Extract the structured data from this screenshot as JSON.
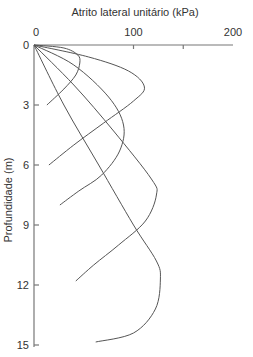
{
  "chart_data": {
    "type": "line",
    "title": "Atrito lateral unitário (kPa)",
    "xlabel": "Atrito lateral unitário (kPa)",
    "ylabel": "Profundidade (m)",
    "xlim": [
      0,
      200
    ],
    "ylim": [
      15,
      0
    ],
    "x_axis_position": "top",
    "y_inverted": true,
    "grid": false,
    "legend": null,
    "x_ticks": [
      0,
      100,
      150,
      200
    ],
    "x_tick_labels": [
      "0",
      "100",
      "",
      "200"
    ],
    "y_ticks": [
      0,
      3,
      6,
      9,
      12,
      15
    ],
    "y_tick_labels": [
      "0",
      "3",
      "6",
      "9",
      "12",
      "15"
    ],
    "series": [
      {
        "name": "Curve 1 (L = 3 m)",
        "points": [
          [
            0,
            0
          ],
          [
            30,
            0.15
          ],
          [
            44,
            0.5
          ],
          [
            46,
            0.9
          ],
          [
            42,
            1.5
          ],
          [
            30,
            2.2
          ],
          [
            13,
            3.0
          ]
        ]
      },
      {
        "name": "Curve 2 (L = 6 m)",
        "points": [
          [
            0,
            0
          ],
          [
            55,
            0.6
          ],
          [
            95,
            1.3
          ],
          [
            111,
            2.1
          ],
          [
            100,
            2.8
          ],
          [
            70,
            3.9
          ],
          [
            40,
            5.0
          ],
          [
            15,
            6.0
          ]
        ]
      },
      {
        "name": "Curve 3 (L = 8 m)",
        "points": [
          [
            0,
            0
          ],
          [
            40,
            1.0
          ],
          [
            75,
            2.6
          ],
          [
            90,
            4.0
          ],
          [
            86,
            5.3
          ],
          [
            68,
            6.5
          ],
          [
            45,
            7.3
          ],
          [
            26,
            8.0
          ]
        ]
      },
      {
        "name": "Curve 4 (L = 12 m)",
        "points": [
          [
            0,
            0
          ],
          [
            40,
            2.0
          ],
          [
            80,
            4.3
          ],
          [
            118,
            6.7
          ],
          [
            123,
            7.5
          ],
          [
            112,
            8.8
          ],
          [
            85,
            10.0
          ],
          [
            60,
            11.0
          ],
          [
            42,
            11.8
          ]
        ]
      },
      {
        "name": "Curve 5 (L = 15 m)",
        "points": [
          [
            0,
            0
          ],
          [
            30,
            3.0
          ],
          [
            65,
            6.0
          ],
          [
            100,
            9.0
          ],
          [
            123,
            10.8
          ],
          [
            127,
            11.7
          ],
          [
            122,
            13.2
          ],
          [
            100,
            14.4
          ],
          [
            62,
            14.85
          ]
        ]
      }
    ]
  }
}
